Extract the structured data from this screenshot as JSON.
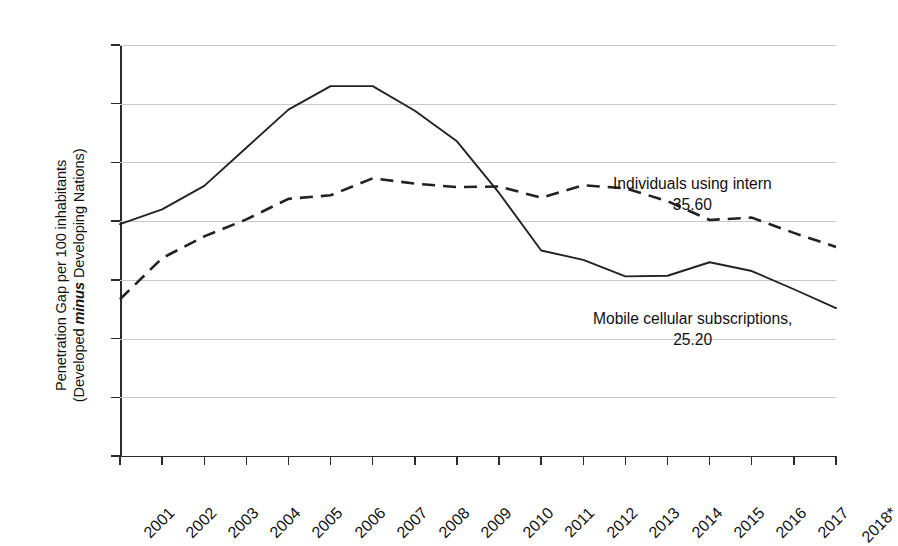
{
  "chart_data": {
    "type": "line",
    "title": "",
    "xlabel": "",
    "ylabel": "Penetration Gap per 100 inhabitants (Developed minus Developing Nations)",
    "ylabel_line1": "Penetration Gap per 100 inhabitants",
    "ylabel_line2_pre": "(Developed ",
    "ylabel_line2_em": "minus",
    "ylabel_line2_post": " Developing Nations)",
    "ylim": [
      0,
      70
    ],
    "y_ticks": [
      0,
      10,
      20,
      30,
      40,
      50,
      60,
      70
    ],
    "y_tick_labels": [
      "0",
      "10",
      "20",
      "30",
      "40",
      "50",
      "60",
      "70"
    ],
    "grid": true,
    "legend_position": "inline-annotation",
    "categories": [
      "2001",
      "2002",
      "2003",
      "2004",
      "2005",
      "2006",
      "2007",
      "2008",
      "2009",
      "2010",
      "2011",
      "2012",
      "2013",
      "2014",
      "2015",
      "2016",
      "2017",
      "2018*"
    ],
    "series": [
      {
        "name": "Mobile cellular subscriptions",
        "style": "solid",
        "end_value": 25.2,
        "end_label": "25.20",
        "values": [
          39.5,
          42.0,
          46.0,
          52.5,
          59.0,
          63.0,
          63.0,
          58.8,
          53.6,
          44.8,
          35.0,
          33.4,
          30.6,
          30.7,
          33.0,
          31.5,
          28.4,
          25.2
        ]
      },
      {
        "name": "Individuals using internet",
        "style": "dashed",
        "end_value": 35.6,
        "end_label": "35.60",
        "values": [
          26.7,
          33.7,
          37.4,
          40.3,
          43.8,
          44.4,
          47.3,
          46.4,
          45.8,
          45.9,
          44.0,
          46.1,
          45.6,
          43.4,
          40.2,
          40.6,
          38.0,
          35.6
        ]
      }
    ],
    "annotations": [
      {
        "id": "internet",
        "label": "Individuals using intern",
        "value": "35.60"
      },
      {
        "id": "mobile",
        "label": "Mobile cellular subscriptions,",
        "value": "25.20"
      }
    ]
  }
}
